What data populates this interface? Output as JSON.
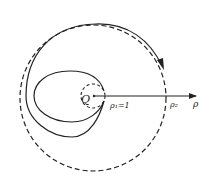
{
  "diagram": {
    "center_label": "Q",
    "inner_radius_label": "ρ₁=1",
    "outer_radius_label": "ρ₂",
    "axis_label": "ρ",
    "colors": {
      "stroke": "#222222",
      "background": "#ffffff"
    }
  }
}
